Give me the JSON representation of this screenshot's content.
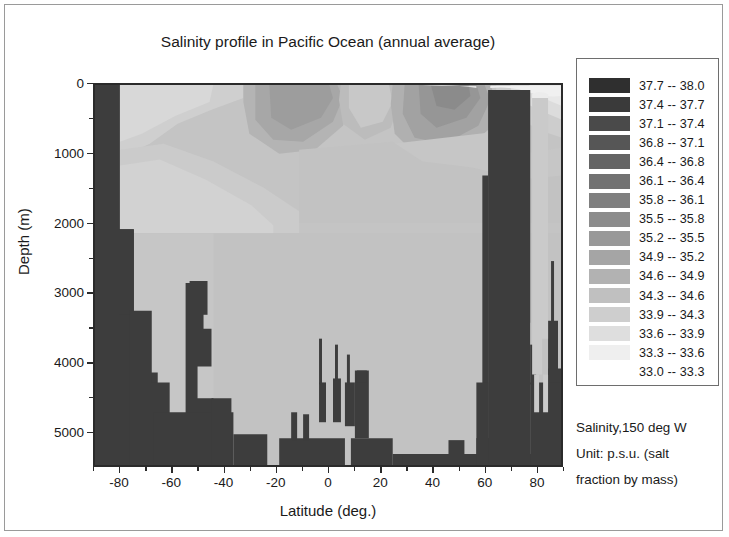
{
  "chart_data": {
    "type": "heatmap",
    "title": "Salinity profile in Pacific Ocean (annual average)",
    "xlabel": "Latitude (deg.)",
    "ylabel": "Depth (m)",
    "xlim": [
      -90,
      90
    ],
    "ylim": [
      0,
      5500
    ],
    "y_inverted": true,
    "grid": false,
    "legend_position": "right",
    "xticks": [
      -80,
      -60,
      -40,
      -20,
      0,
      20,
      40,
      60,
      80
    ],
    "xtick_labels": [
      "-80",
      "-60",
      "-40",
      "-20",
      "0",
      "20",
      "40",
      "60",
      "80"
    ],
    "xticks_minor": [
      -90,
      -70,
      -50,
      -30,
      -10,
      10,
      30,
      50,
      70,
      90
    ],
    "yticks": [
      0,
      1000,
      2000,
      3000,
      4000,
      5000
    ],
    "ytick_labels": [
      "0",
      "1000",
      "2000",
      "3000",
      "4000",
      "5000"
    ],
    "yticks_minor": [
      500,
      1500,
      2500,
      3500,
      4500
    ],
    "units": "p.s.u.",
    "section_longitude": "150 deg W",
    "colorbar": {
      "variable": "Salinity",
      "min": 33.0,
      "max": 38.0,
      "n_bins": 16,
      "bin_edges": [
        33.0,
        33.3,
        33.6,
        33.9,
        34.3,
        34.6,
        34.9,
        35.2,
        35.5,
        35.8,
        36.1,
        36.4,
        36.8,
        37.1,
        37.4,
        37.7,
        38.0
      ]
    },
    "legend_entries": [
      {
        "label": "37.7  --  38.0",
        "low": 37.7,
        "high": 38.0,
        "color": "#2f2f2f",
        "blank": false
      },
      {
        "label": "37.4  --  37.7",
        "low": 37.4,
        "high": 37.7,
        "color": "#3a3a3a",
        "blank": false
      },
      {
        "label": "37.1  --  37.4",
        "low": 37.1,
        "high": 37.4,
        "color": "#4a4a4a",
        "blank": false
      },
      {
        "label": "36.8  --  37.1",
        "low": 36.8,
        "high": 37.1,
        "color": "#565656",
        "blank": false
      },
      {
        "label": "36.4  --  36.8",
        "low": 36.4,
        "high": 36.8,
        "color": "#646464",
        "blank": false
      },
      {
        "label": "36.1  --  36.4",
        "low": 36.1,
        "high": 36.4,
        "color": "#727272",
        "blank": false
      },
      {
        "label": "35.8  --  36.1",
        "low": 35.8,
        "high": 36.1,
        "color": "#7f7f7f",
        "blank": false
      },
      {
        "label": "35.5  --  35.8",
        "low": 35.5,
        "high": 35.8,
        "color": "#8c8c8c",
        "blank": false
      },
      {
        "label": "35.2  --  35.5",
        "low": 35.2,
        "high": 35.5,
        "color": "#999999",
        "blank": false
      },
      {
        "label": "34.9  --  35.2",
        "low": 34.9,
        "high": 35.2,
        "color": "#a5a5a5",
        "blank": false
      },
      {
        "label": "34.6  --  34.9",
        "low": 34.6,
        "high": 34.9,
        "color": "#b2b2b2",
        "blank": false
      },
      {
        "label": "34.3  --  34.6",
        "low": 34.3,
        "high": 34.6,
        "color": "#c0c0c0",
        "blank": false
      },
      {
        "label": "33.9  --  34.3",
        "low": 33.9,
        "high": 34.3,
        "color": "#cecece",
        "blank": false
      },
      {
        "label": "33.6  --  33.9",
        "low": 33.6,
        "high": 33.9,
        "color": "#dedede",
        "blank": false
      },
      {
        "label": "33.3  --  33.6",
        "low": 33.3,
        "high": 33.6,
        "color": "#efefef",
        "blank": false
      },
      {
        "label": "33.0  --  33.3",
        "low": 33.0,
        "high": 33.3,
        "color": "#ffffff",
        "blank": true
      }
    ],
    "caption_lines": [
      "Salinity,150 deg W",
      "Unit: p.s.u. (salt",
      "fraction by mass)"
    ],
    "land_color": "#3d3d3d"
  }
}
